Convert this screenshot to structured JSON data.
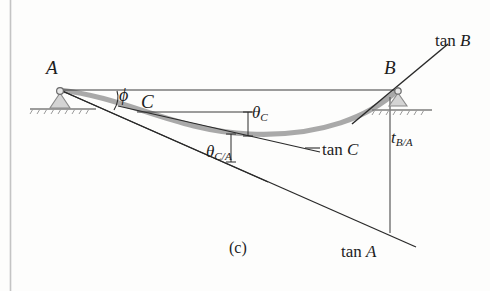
{
  "figure": {
    "caption": "(c)",
    "colors": {
      "ink": "#1c1c1c",
      "elastic_curve": "#a8a8a8",
      "support_fill": "#c9c9c9",
      "page_edge": "#c0c0c0",
      "background": "#fdfdfc"
    },
    "points": [
      {
        "id": "A",
        "label": "A",
        "x": 60,
        "y": 90,
        "support": "pin"
      },
      {
        "id": "B",
        "label": "B",
        "x": 398,
        "y": 90,
        "support": "roller"
      },
      {
        "id": "C",
        "label": "C",
        "x": 137,
        "y": 112,
        "support": "none"
      }
    ],
    "tangent_lines": [
      {
        "id": "tan-A",
        "label": "tan A",
        "from": "A",
        "note": "tangent at A, sloping down to the right"
      },
      {
        "id": "tan-B",
        "label": "tan B",
        "from": "B",
        "note": "tangent at B, sloping up to the right"
      },
      {
        "id": "tan-C",
        "label": "tan C",
        "from": "C",
        "note": "tangent at C, sloping down to the right"
      }
    ],
    "angles": [
      {
        "id": "phi",
        "label": "ϕ",
        "note": "angle between chord AB and tangent at A"
      },
      {
        "id": "theta-C",
        "label": "θ",
        "subscript": "C",
        "note": "slope angle of elastic curve at C"
      },
      {
        "id": "theta-C-over-A",
        "label": "θ",
        "subscript": "C/A",
        "note": "angle between tan A and tan C"
      }
    ],
    "deviations": [
      {
        "id": "t-B-over-A",
        "label": "t",
        "subscript": "B/A",
        "note": "vertical deviation of B from tangent at A"
      }
    ],
    "labels": {
      "A": "A",
      "B": "B",
      "C": "C",
      "phi": "ϕ",
      "theta": "θ",
      "theta_C_sub": "C",
      "theta_CA_sub": "C/A",
      "t": "t",
      "t_BA_sub": "B/A",
      "tan": "tan",
      "tan_A_var": "A",
      "tan_B_var": "B",
      "tan_C_var": "C",
      "caption": "(c)"
    }
  }
}
